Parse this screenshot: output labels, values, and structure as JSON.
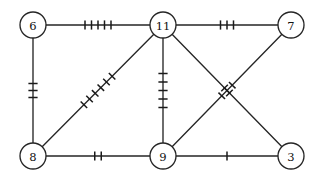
{
  "diagram": {
    "width": 324,
    "height": 180,
    "background_color": "#ffffff",
    "stroke_color": "#262626",
    "label_color": "#111111",
    "node_radius": 13,
    "nodes": [
      {
        "id": "n6",
        "label": "6",
        "cx": 33,
        "cy": 25
      },
      {
        "id": "n11",
        "label": "11",
        "cx": 163,
        "cy": 25
      },
      {
        "id": "n7",
        "label": "7",
        "cx": 291,
        "cy": 25
      },
      {
        "id": "n8",
        "label": "8",
        "cx": 33,
        "cy": 156
      },
      {
        "id": "n9",
        "label": "9",
        "cx": 163,
        "cy": 156
      },
      {
        "id": "n3",
        "label": "3",
        "cx": 291,
        "cy": 156
      }
    ],
    "edges": [
      {
        "id": "e-6-11",
        "from": "n6",
        "to": "n11",
        "ticks": 5,
        "tick_spacing": 6.5
      },
      {
        "id": "e-11-7",
        "from": "n11",
        "to": "n7",
        "ticks": 3,
        "tick_spacing": 6.5
      },
      {
        "id": "e-6-8",
        "from": "n6",
        "to": "n8",
        "ticks": 3,
        "tick_spacing": 7.0
      },
      {
        "id": "e-8-11",
        "from": "n8",
        "to": "n11",
        "ticks": 6,
        "tick_spacing": 8.0
      },
      {
        "id": "e-11-9",
        "from": "n11",
        "to": "n9",
        "ticks": 5,
        "tick_spacing": 8.5
      },
      {
        "id": "e-9-7",
        "from": "n9",
        "to": "n7",
        "ticks": 3,
        "tick_spacing": 7.5
      },
      {
        "id": "e-11-3",
        "from": "n11",
        "to": "n3",
        "ticks": 2,
        "tick_spacing": 7.0
      },
      {
        "id": "e-8-9",
        "from": "n8",
        "to": "n9",
        "ticks": 2,
        "tick_spacing": 6.5
      },
      {
        "id": "e-9-3",
        "from": "n9",
        "to": "n3",
        "ticks": 1,
        "tick_spacing": 6.5
      }
    ],
    "tick_half_length": 4.6
  }
}
